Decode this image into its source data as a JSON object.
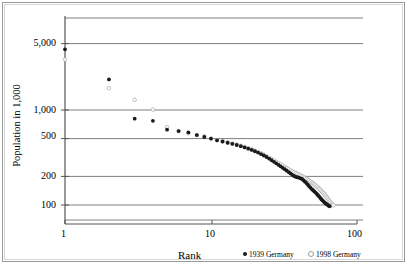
{
  "chart_data": {
    "type": "scatter",
    "title": "",
    "xlabel": "Rank",
    "ylabel": "Population in 1,000",
    "xscale": "log",
    "yscale": "log",
    "xlim": [
      1,
      100
    ],
    "ylim": [
      70,
      7000
    ],
    "grid": true,
    "grid_axis": "y",
    "legend_position": "below-right",
    "xticks": [
      1,
      10,
      100
    ],
    "xticklabels": [
      "1",
      "10",
      "100"
    ],
    "yticks": [
      100,
      200,
      500,
      1000,
      5000
    ],
    "yticklabels": [
      "100",
      "200",
      "500",
      "1,000",
      "5,000"
    ],
    "series": [
      {
        "name": "1939 Germany",
        "marker": "filled-diamond",
        "color": "#1a1a1a",
        "points": [
          [
            1,
            4350
          ],
          [
            2,
            2100
          ],
          [
            3,
            810
          ],
          [
            4,
            770
          ],
          [
            5,
            620
          ],
          [
            6,
            600
          ],
          [
            7,
            580
          ],
          [
            8,
            545
          ],
          [
            9,
            520
          ],
          [
            10,
            500
          ],
          [
            11,
            480
          ],
          [
            12,
            466
          ],
          [
            13,
            452
          ],
          [
            14,
            440
          ],
          [
            15,
            428
          ],
          [
            16,
            416
          ],
          [
            17,
            404
          ],
          [
            18,
            392
          ],
          [
            19,
            380
          ],
          [
            20,
            368
          ],
          [
            21,
            356
          ],
          [
            22,
            344
          ],
          [
            23,
            332
          ],
          [
            24,
            320
          ],
          [
            25,
            308
          ],
          [
            26,
            296
          ],
          [
            27,
            285
          ],
          [
            28,
            274
          ],
          [
            29,
            264
          ],
          [
            30,
            255
          ],
          [
            31,
            246
          ],
          [
            32,
            238
          ],
          [
            33,
            230
          ],
          [
            34,
            222
          ],
          [
            35,
            215
          ],
          [
            36,
            208
          ],
          [
            37,
            202
          ],
          [
            38,
            198
          ],
          [
            39,
            196
          ],
          [
            40,
            194
          ],
          [
            41,
            191
          ],
          [
            42,
            188
          ],
          [
            43,
            182
          ],
          [
            44,
            176
          ],
          [
            45,
            170
          ],
          [
            46,
            164
          ],
          [
            47,
            158
          ],
          [
            48,
            152
          ],
          [
            49,
            147
          ],
          [
            50,
            143
          ],
          [
            51,
            139
          ],
          [
            52,
            135
          ],
          [
            53,
            131
          ],
          [
            54,
            127
          ],
          [
            55,
            123
          ],
          [
            56,
            119
          ],
          [
            57,
            115
          ],
          [
            58,
            112
          ],
          [
            59,
            109
          ],
          [
            60,
            106
          ],
          [
            61,
            104
          ],
          [
            62,
            102
          ],
          [
            63,
            100
          ],
          [
            64,
            98
          ],
          [
            65,
            97
          ]
        ]
      },
      {
        "name": "1998 Germany",
        "marker": "hollow-circle",
        "color": "#a8a8a8",
        "points": [
          [
            1,
            3400
          ],
          [
            2,
            1700
          ],
          [
            3,
            1280
          ],
          [
            4,
            1010
          ],
          [
            5,
            660
          ],
          [
            6,
            600
          ],
          [
            7,
            570
          ],
          [
            8,
            545
          ],
          [
            9,
            530
          ],
          [
            10,
            500
          ],
          [
            11,
            480
          ],
          [
            12,
            468
          ],
          [
            13,
            455
          ],
          [
            14,
            444
          ],
          [
            15,
            432
          ],
          [
            16,
            420
          ],
          [
            17,
            408
          ],
          [
            18,
            396
          ],
          [
            19,
            385
          ],
          [
            20,
            373
          ],
          [
            21,
            362
          ],
          [
            22,
            350
          ],
          [
            23,
            338
          ],
          [
            24,
            326
          ],
          [
            25,
            315
          ],
          [
            26,
            304
          ],
          [
            27,
            294
          ],
          [
            28,
            285
          ],
          [
            29,
            276
          ],
          [
            30,
            268
          ],
          [
            31,
            260
          ],
          [
            32,
            252
          ],
          [
            33,
            245
          ],
          [
            34,
            238
          ],
          [
            35,
            232
          ],
          [
            36,
            226
          ],
          [
            37,
            221
          ],
          [
            38,
            217
          ],
          [
            39,
            213
          ],
          [
            40,
            209
          ],
          [
            41,
            205
          ],
          [
            42,
            201
          ],
          [
            43,
            197
          ],
          [
            44,
            193
          ],
          [
            45,
            189
          ],
          [
            46,
            185
          ],
          [
            47,
            181
          ],
          [
            48,
            177
          ],
          [
            49,
            173
          ],
          [
            50,
            169
          ],
          [
            51,
            165
          ],
          [
            52,
            161
          ],
          [
            53,
            157
          ],
          [
            54,
            153
          ],
          [
            55,
            149
          ],
          [
            56,
            145
          ],
          [
            57,
            141
          ],
          [
            58,
            137
          ],
          [
            59,
            133
          ],
          [
            60,
            129
          ],
          [
            61,
            125
          ],
          [
            62,
            121
          ],
          [
            63,
            117
          ],
          [
            64,
            113
          ],
          [
            65,
            109
          ],
          [
            66,
            106
          ],
          [
            67,
            103
          ],
          [
            68,
            101
          ],
          [
            69,
            99
          ]
        ]
      }
    ]
  },
  "legend": {
    "items": [
      {
        "label": "1939 Germany",
        "marker": "filled"
      },
      {
        "label": "1998 Germany",
        "marker": "hollow"
      }
    ]
  },
  "axis": {
    "x_title": "Rank",
    "y_title": "Population in 1,000"
  }
}
